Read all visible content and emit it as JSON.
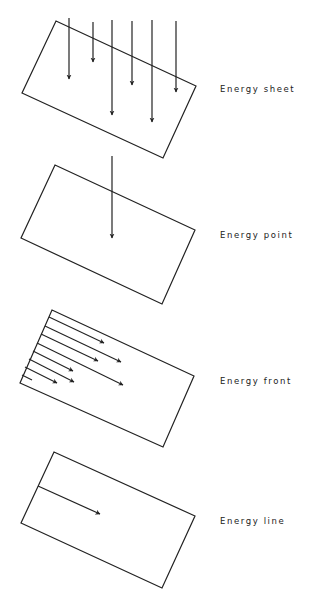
{
  "panels": [
    {
      "id": "sheet",
      "label": "Energy sheet",
      "label_pos": [
        220,
        84
      ]
    },
    {
      "id": "point",
      "label": "Energy point",
      "label_pos": [
        220,
        230
      ]
    },
    {
      "id": "front",
      "label": "Energy front",
      "label_pos": [
        220,
        376
      ]
    },
    {
      "id": "line",
      "label": "Energy line",
      "label_pos": [
        220,
        516
      ]
    }
  ],
  "colors": {
    "stroke": "#222222",
    "background": "#ffffff"
  }
}
